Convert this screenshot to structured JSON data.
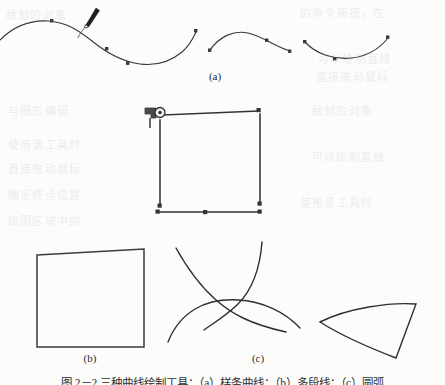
{
  "page": {
    "kind": "scanned-textbook-figure-page",
    "background_color": "#fcfcfb",
    "ink_color": "#333333",
    "paper_tint_color": "#ecedee"
  },
  "panels": [
    {
      "id": "a",
      "label": "(a)",
      "title": "spline-curves-with-pen-cursor",
      "elements": [
        "spline-curve-long",
        "spline-curve-middle",
        "spline-curve-right",
        "pen-cursor",
        "node-markers"
      ]
    },
    {
      "id": "b",
      "label": "(b)",
      "title": "polyline-rectangle-and-square",
      "elements": [
        "polyline-open-rectangle",
        "pen-cursor",
        "endpoint-markers",
        "square-outline"
      ]
    },
    {
      "id": "c",
      "label": "(c)",
      "title": "arcs-and-curved-triangle",
      "elements": [
        "arc-wide",
        "arc-crossing-left",
        "arc-crossing-right",
        "curved-triangle"
      ]
    }
  ],
  "caption": {
    "text": "图 2－2  三种曲线绘制工具：（a）样条曲线；（b）多段线；（c）圆弧",
    "clipped": true
  },
  "bleed_through": [
    "绘制的对象",
    "的命令按钮，在",
    "可以绘制直线",
    "与图形编辑",
    "使用该工具时",
    "直接拖动鼠标",
    "确定终点位置",
    "绘图区域中的"
  ]
}
